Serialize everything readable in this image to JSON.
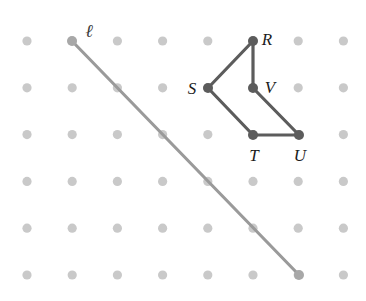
{
  "figure": {
    "width": 366,
    "height": 301,
    "background_color": "#ffffff"
  },
  "grid": {
    "columns": 8,
    "rows": 6,
    "origin_x": 27,
    "origin_y": 41,
    "spacing_x": 45.2,
    "spacing_y": 46.8,
    "dot_radius": 4.6,
    "dot_color": "#c9c9c9"
  },
  "line": {
    "name": "ell",
    "label": "ℓ",
    "label_x": 89,
    "label_y": 31,
    "color": "#9a9a9a",
    "start_x": 72,
    "start_y": 41,
    "end_x": 299,
    "end_y": 275,
    "endpoint_radius": 5
  },
  "polygon": {
    "stroke_color": "#5c5c5c",
    "vertex_color": "#5c5c5c",
    "vertex_radius": 5,
    "vertices": [
      {
        "id": "R",
        "label": "R",
        "x": 253,
        "y": 41,
        "label_x": 267,
        "label_y": 39
      },
      {
        "id": "S",
        "label": "S",
        "x": 208,
        "y": 88,
        "label_x": 192,
        "label_y": 88
      },
      {
        "id": "V",
        "label": "V",
        "x": 253,
        "y": 88,
        "label_x": 270,
        "label_y": 87
      },
      {
        "id": "T",
        "label": "T",
        "x": 253,
        "y": 135,
        "label_x": 254,
        "label_y": 155
      },
      {
        "id": "U",
        "label": "U",
        "x": 299,
        "y": 135,
        "label_x": 300,
        "label_y": 155
      }
    ],
    "edges": [
      {
        "name": "edge-R-S",
        "from": "R",
        "to": "S"
      },
      {
        "name": "edge-R-V",
        "from": "R",
        "to": "V"
      },
      {
        "name": "edge-S-T",
        "from": "S",
        "to": "T"
      },
      {
        "name": "edge-V-U",
        "from": "V",
        "to": "U"
      },
      {
        "name": "edge-T-U",
        "from": "T",
        "to": "U"
      }
    ]
  }
}
